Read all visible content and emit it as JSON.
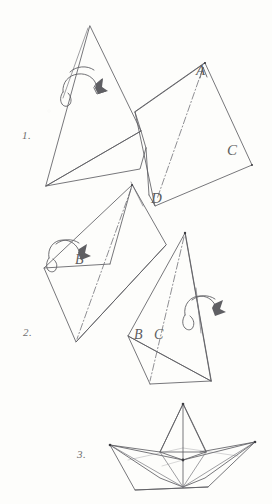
{
  "page": {
    "medium": "pencil sketch on white paper",
    "ink_color": "#5a5a5e",
    "paper_color": "#fdfdfb"
  },
  "steps": [
    {
      "id": "step-1",
      "number": "1."
    },
    {
      "id": "step-2",
      "number": "2."
    },
    {
      "id": "step-3",
      "number": "3."
    }
  ],
  "vertex_labels": {
    "a": "A",
    "c": "C",
    "d": "D",
    "b_step2_left": "B",
    "b_step2_right": "B",
    "c_step2_right": "C"
  },
  "annotations": {
    "rotation_arrow_1": "curved fold-over arrow",
    "rotation_arrow_2": "curved fold-over arrow",
    "rotation_arrow_3": "curved fold-over arrow"
  }
}
